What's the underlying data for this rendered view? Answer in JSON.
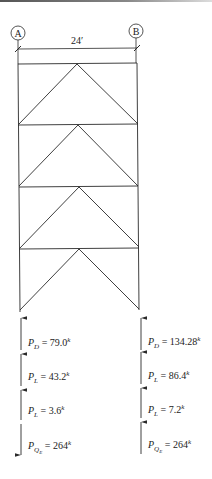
{
  "diagram": {
    "type": "braced-frame-elevation",
    "gridlines": [
      {
        "id": "A",
        "label": "A"
      },
      {
        "id": "B",
        "label": "B"
      }
    ],
    "span_dimension": "24′",
    "stories": 4,
    "bracing": "chevron (inverted V) per story",
    "loads": {
      "column_A": [
        {
          "symbol": "P",
          "subscript": "D",
          "value": "79.0",
          "unit": "k",
          "direction": "up"
        },
        {
          "symbol": "P",
          "subscript": "L",
          "value": "43.2",
          "unit": "k",
          "direction": "up"
        },
        {
          "symbol": "P",
          "subscript": "L",
          "value": "3.6",
          "unit": "k",
          "direction": "up"
        },
        {
          "symbol": "P",
          "subscript": "QE",
          "value": "264",
          "unit": "k",
          "direction": "down"
        }
      ],
      "column_B": [
        {
          "symbol": "P",
          "subscript": "D",
          "value": "134.28",
          "unit": "k",
          "direction": "up"
        },
        {
          "symbol": "P",
          "subscript": "L",
          "value": "86.4",
          "unit": "k",
          "direction": "up"
        },
        {
          "symbol": "P",
          "subscript": "L",
          "value": "7.2",
          "unit": "k",
          "direction": "up"
        },
        {
          "symbol": "P",
          "subscript": "QE",
          "value": "264",
          "unit": "k",
          "direction": "up"
        }
      ]
    },
    "colors": {
      "line": "#2a2a2a",
      "background": "#ffffff"
    }
  }
}
